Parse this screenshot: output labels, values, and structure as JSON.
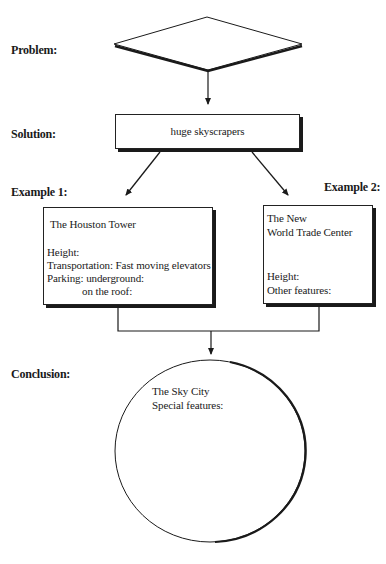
{
  "labels": {
    "problem": "Problem:",
    "solution": "Solution:",
    "example1": "Example 1:",
    "example2": "Example 2:",
    "conclusion": "Conclusion:"
  },
  "problem": {
    "text": ""
  },
  "solution": {
    "text": "huge skyscrapers"
  },
  "example1": {
    "title": "The Houston Tower",
    "lines": [
      "Height:",
      "Transportation: Fast moving elevators",
      "Parking: underground:",
      "on the roof:"
    ]
  },
  "example2": {
    "title_lines": [
      "The New",
      "World Trade Center"
    ],
    "lines": [
      "Height:",
      "Other features:"
    ]
  },
  "conclusion": {
    "title": "The Sky City",
    "lines": [
      "Special features:"
    ]
  },
  "colors": {
    "line": "#1a1a1a",
    "background": "#ffffff"
  }
}
